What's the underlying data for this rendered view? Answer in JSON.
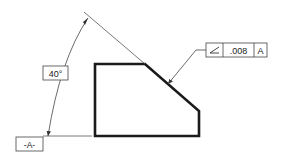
{
  "drawing": {
    "title": "Angularity tolerance callout",
    "angle_dimension": {
      "value": "40°"
    },
    "datum_feature": {
      "label": "-A-"
    },
    "feature_control_frame": {
      "symbol": "angularity",
      "symbol_glyph": "∠",
      "tolerance": ".008",
      "datum_reference": "A"
    }
  }
}
